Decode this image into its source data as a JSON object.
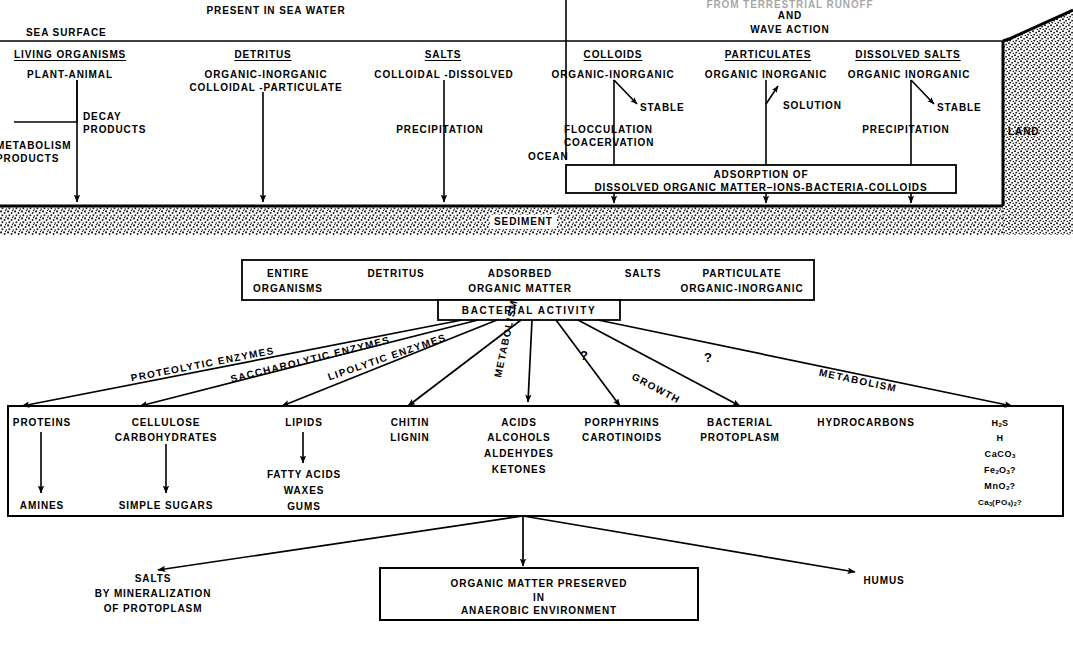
{
  "figure": {
    "title_top_left": "PRESENT IN SEA WATER",
    "title_top_right_line1": "FROM TERRESTRIAL RUNOFF",
    "title_top_right_line2": "AND",
    "title_top_right_line3": "WAVE ACTION",
    "sea_surface_label": "SEA SURFACE",
    "ocean_label": "OCEAN",
    "land_label": "LAND",
    "sediment_label": "SEDIMENT",
    "ink_color": "#000000",
    "paper_color": "#ffffff"
  },
  "sea_columns": [
    {
      "header": "LIVING ORGANISMS",
      "lines": [
        "PLANT-ANIMAL"
      ],
      "branch_label_lines": [
        "METABOLISM",
        "PRODUCTS"
      ],
      "side_label_lines": [
        "DECAY",
        "PRODUCTS"
      ]
    },
    {
      "header": "DETRITUS",
      "lines": [
        "ORGANIC-INORGANIC",
        "COLLOIDAL -PARTICULATE"
      ]
    },
    {
      "header": "SALTS",
      "lines": [
        "COLLOIDAL -DISSOLVED"
      ],
      "process": "PRECIPITATION"
    }
  ],
  "land_columns": [
    {
      "header": "COLLOIDS",
      "lines": [
        "ORGANIC-INORGANIC"
      ],
      "stable_label": "STABLE",
      "process_lines": [
        "FLOCCULATION",
        "COACERVATION"
      ]
    },
    {
      "header": "PARTICULATES",
      "lines": [
        "ORGANIC INORGANIC"
      ],
      "stable_label": "SOLUTION"
    },
    {
      "header": "DISSOLVED SALTS",
      "lines": [
        "ORGANIC INORGANIC"
      ],
      "stable_label": "STABLE",
      "process_lines": [
        "PRECIPITATION"
      ]
    }
  ],
  "adsorption_box": {
    "line1": "ADSORPTION OF",
    "line2": "DISSOLVED ORGANIC MATTER–IONS-BACTERIA-COLLOIDS"
  },
  "substrate_box": {
    "items": [
      {
        "line1": "ENTIRE",
        "line2": "ORGANISMS"
      },
      {
        "line1": "DETRITUS",
        "line2": ""
      },
      {
        "line1": "ADSORBED",
        "line2": "ORGANIC MATTER"
      },
      {
        "line1": "SALTS",
        "line2": ""
      },
      {
        "line1": "PARTICULATE",
        "line2": "ORGANIC-INORGANIC"
      }
    ]
  },
  "bacterial_box": {
    "label": "BACTERIAL  ACTIVITY"
  },
  "pathways": [
    {
      "label": "PROTEOLYTIC ENZYMES"
    },
    {
      "label": "SACCHAROLYTIC ENZYMES"
    },
    {
      "label": "LIPOLYTIC ENZYMES"
    },
    {
      "label": "METABOLISM"
    },
    {
      "label": "?"
    },
    {
      "label": "GROWTH"
    },
    {
      "label": "?"
    },
    {
      "label": "METABOLISM"
    }
  ],
  "products": [
    {
      "primary": [
        "PROTEINS"
      ],
      "secondary": [
        "AMINES"
      ]
    },
    {
      "primary": [
        "CELLULOSE",
        "CARBOHYDRATES"
      ],
      "secondary": [
        "SIMPLE SUGARS"
      ]
    },
    {
      "primary": [
        "LIPIDS"
      ],
      "secondary": [
        "FATTY ACIDS",
        "WAXES",
        "GUMS"
      ]
    },
    {
      "primary": [
        "CHITIN",
        "LIGNIN"
      ],
      "secondary": []
    },
    {
      "primary": [
        "ACIDS",
        "ALCOHOLS",
        "ALDEHYDES",
        "KETONES"
      ],
      "secondary": []
    },
    {
      "primary": [
        "PORPHYRINS",
        "CAROTINOIDS"
      ],
      "secondary": []
    },
    {
      "primary": [
        "BACTERIAL",
        "PROTOPLASM"
      ],
      "secondary": []
    },
    {
      "primary": [
        "HYDROCARBONS"
      ],
      "secondary": []
    }
  ],
  "minerals": [
    {
      "formula": "H2S",
      "html": "H<sub>2</sub>S"
    },
    {
      "formula": "H",
      "html": "H"
    },
    {
      "formula": "CaCO3",
      "html": "CaCO<sub>3</sub>"
    },
    {
      "formula": "Fe2O3?",
      "html": "Fe<sub>2</sub>O<sub>3</sub>?"
    },
    {
      "formula": "MnO2?",
      "html": "MnO<sub>2</sub>?"
    },
    {
      "formula": "Ca3(PO4)2?",
      "html": "Ca<sub>3</sub>(PO<sub>4</sub>)<sub>2</sub>?"
    }
  ],
  "outcomes": {
    "left": {
      "line1": "SALTS",
      "line2": "BY MINERALIZATION",
      "line3": "OF PROTOPLASM"
    },
    "center": {
      "line1": "ORGANIC MATTER PRESERVED",
      "line2": "IN",
      "line3": "ANAEROBIC ENVIRONMENT"
    },
    "right": {
      "line1": "HUMUS"
    }
  }
}
